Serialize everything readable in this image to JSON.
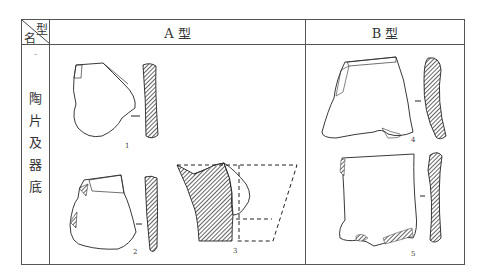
{
  "table": {
    "corner": {
      "type_label": "型",
      "name_label": "名"
    },
    "columns": [
      {
        "label": "A 型"
      },
      {
        "label": "B 型"
      }
    ],
    "row": {
      "marker": "-",
      "label_chars": [
        "陶",
        "片",
        "及",
        "器",
        "底"
      ]
    }
  },
  "figures": [
    {
      "number": "1",
      "group": "A 型"
    },
    {
      "number": "2",
      "group": "A 型"
    },
    {
      "number": "3",
      "group": "A 型"
    },
    {
      "number": "4",
      "group": "B 型"
    },
    {
      "number": "5",
      "group": "B 型"
    }
  ]
}
